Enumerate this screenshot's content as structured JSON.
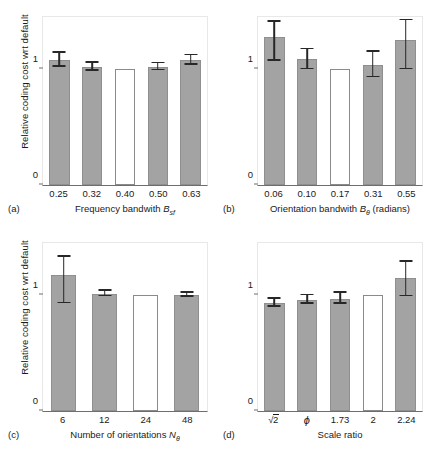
{
  "figure": {
    "ylabel": "Relative coding cost wrt default",
    "ytick_labels": [
      "1",
      "0"
    ]
  },
  "chart_data": [
    {
      "type": "bar",
      "panel": "(a)",
      "title": "",
      "xlabel": "Frequency bandwith B",
      "xlabel_sub": "sf",
      "ylabel": "Relative coding cost wrt default",
      "categories": [
        "0.25",
        "0.32",
        "0.40",
        "0.50",
        "0.63"
      ],
      "values": [
        1.08,
        1.02,
        1.0,
        1.02,
        1.08
      ],
      "err_low": [
        1.02,
        0.985,
        1.0,
        0.99,
        1.04
      ],
      "err_high": [
        1.14,
        1.055,
        1.0,
        1.05,
        1.12
      ],
      "default_index": 2,
      "ylim": [
        0,
        1.45
      ],
      "yticks": [
        0,
        1
      ]
    },
    {
      "type": "bar",
      "panel": "(b)",
      "title": "",
      "xlabel": "Orientation bandwith B",
      "xlabel_sub": "θ",
      "xlabel_suffix": " (radians)",
      "ylabel": "Relative coding cost wrt default",
      "categories": [
        "0.06",
        "0.10",
        "0.17",
        "0.31",
        "0.55"
      ],
      "values": [
        1.28,
        1.09,
        1.0,
        1.04,
        1.25
      ],
      "err_low": [
        1.07,
        1.0,
        1.0,
        0.93,
        1.0
      ],
      "err_high": [
        1.41,
        1.17,
        1.0,
        1.15,
        1.42
      ],
      "default_index": 2,
      "ylim": [
        0,
        1.45
      ],
      "yticks": [
        0,
        1
      ]
    },
    {
      "type": "bar",
      "panel": "(c)",
      "title": "",
      "xlabel": "Number of orientations N",
      "xlabel_sub": "θ",
      "ylabel": "Relative coding cost wrt default",
      "categories": [
        "6",
        "12",
        "24",
        "48"
      ],
      "values": [
        1.17,
        1.01,
        1.0,
        1.0
      ],
      "err_low": [
        0.93,
        0.99,
        1.0,
        0.985
      ],
      "err_high": [
        1.33,
        1.04,
        1.0,
        1.02
      ],
      "default_index": 2,
      "ylim": [
        0,
        1.45
      ],
      "yticks": [
        0,
        1
      ]
    },
    {
      "type": "bar",
      "panel": "(d)",
      "title": "",
      "xlabel": "Scale ratio",
      "ylabel": "Relative coding cost wrt default",
      "categories": [
        "√2",
        "φ",
        "1.73",
        "2",
        "2.24"
      ],
      "values": [
        0.93,
        0.96,
        0.97,
        1.0,
        1.15
      ],
      "err_low": [
        0.9,
        0.925,
        0.925,
        1.0,
        0.99
      ],
      "err_high": [
        0.97,
        1.0,
        1.02,
        1.0,
        1.29
      ],
      "default_index": 3,
      "ylim": [
        0,
        1.45
      ],
      "yticks": [
        0,
        1
      ]
    }
  ]
}
